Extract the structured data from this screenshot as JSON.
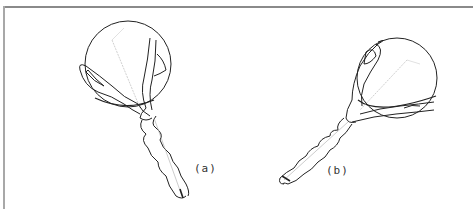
{
  "figure": {
    "panels": [
      {
        "id": "a",
        "label": "(a)"
      },
      {
        "id": "b",
        "label": "(b)"
      }
    ],
    "colors": {
      "line": "#222222",
      "frame": "#8a8a8a",
      "background": "#ffffff",
      "axis_line": "#b0b0b0"
    }
  }
}
